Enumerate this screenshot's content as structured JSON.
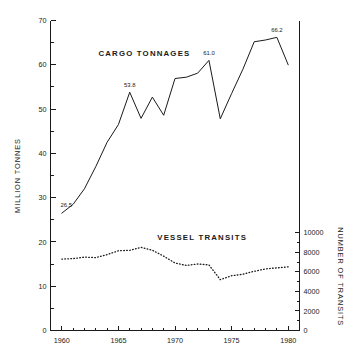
{
  "chart_data": {
    "type": "line",
    "title": "",
    "xlabel": "",
    "ylabel": "MILLION TONNES",
    "y2label": "NUMBER OF TRANSITS",
    "grid": false,
    "legend_position": "inline-annotation",
    "xlim": [
      1959,
      1981
    ],
    "ylim": [
      0,
      70
    ],
    "y2lim": [
      0,
      11000
    ],
    "x_ticks": [
      1960,
      1965,
      1970,
      1975,
      1980
    ],
    "x_tick_labels": [
      "1960",
      "1965",
      "1970",
      "1975",
      "1980"
    ],
    "y_ticks": [
      0,
      10,
      20,
      30,
      40,
      50,
      60,
      70
    ],
    "y_tick_labels": [
      "0",
      "10",
      "20",
      "30",
      "40",
      "50",
      "60",
      "70"
    ],
    "y_minor_ticks": [
      5,
      15,
      25,
      35,
      45,
      55,
      65
    ],
    "y2_ticks": [
      0,
      2000,
      4000,
      6000,
      8000,
      10000
    ],
    "y2_tick_labels": [
      "0",
      "2000",
      "4000",
      "6000",
      "8000",
      "10000"
    ],
    "y2_minor_ticks": [
      1000,
      3000,
      5000,
      7000,
      9000
    ],
    "x": [
      1960,
      1961,
      1962,
      1963,
      1964,
      1965,
      1966,
      1967,
      1968,
      1969,
      1970,
      1971,
      1972,
      1973,
      1974,
      1975,
      1976,
      1977,
      1978,
      1979,
      1980
    ],
    "series": [
      {
        "name": "CARGO TONNAGES",
        "axis": "left",
        "units": "million tonnes",
        "style": "solid",
        "values": [
          26.5,
          28.5,
          32.0,
          37.0,
          42.5,
          46.5,
          53.8,
          47.9,
          52.7,
          48.6,
          56.9,
          57.2,
          58.1,
          61.0,
          47.8,
          53.5,
          59.0,
          65.2,
          65.6,
          66.2,
          60.0
        ]
      },
      {
        "name": "VESSEL TRANSITS",
        "axis": "right",
        "units": "transits",
        "style": "dotted",
        "values": [
          7300,
          7350,
          7500,
          7450,
          7750,
          8150,
          8200,
          8500,
          8200,
          7600,
          6900,
          6650,
          6800,
          6700,
          5200,
          5600,
          5750,
          6050,
          6300,
          6400,
          6500
        ]
      }
    ],
    "annotations": [
      {
        "label": "26.5",
        "x": 1960,
        "y": 26.5
      },
      {
        "label": "53.8",
        "x": 1966,
        "y": 53.8
      },
      {
        "label": "61.0",
        "x": 1973,
        "y": 61.0
      },
      {
        "label": "66.2",
        "x": 1979,
        "y": 66.2
      }
    ],
    "series_labels": [
      {
        "text": "CARGO TONNAGES",
        "x": 1967.3,
        "y": 62.0
      },
      {
        "text": "VESSEL TRANSITS",
        "x": 1972.4,
        "y": 20.4
      }
    ],
    "colors": {
      "line": "#1a1a1a",
      "background": "#ffffff",
      "text": "#1a1a1a"
    }
  }
}
